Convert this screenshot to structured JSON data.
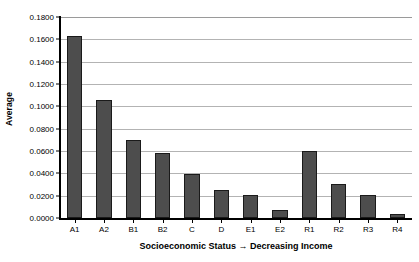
{
  "chart_data": {
    "type": "bar",
    "title": "",
    "xlabel": "Socioeconomic Status → Decreasing Income",
    "ylabel": "Average",
    "categories": [
      "A1",
      "A2",
      "B1",
      "B2",
      "C",
      "D",
      "E1",
      "E2",
      "R1",
      "R2",
      "R3",
      "R4"
    ],
    "values": [
      0.163,
      0.106,
      0.07,
      0.0585,
      0.039,
      0.025,
      0.0205,
      0.007,
      0.06,
      0.0305,
      0.0205,
      0.0035
    ],
    "series": [
      {
        "name": "Average",
        "values": [
          0.163,
          0.106,
          0.07,
          0.0585,
          0.039,
          0.025,
          0.0205,
          0.007,
          0.06,
          0.0305,
          0.0205,
          0.0035
        ]
      }
    ],
    "ylim": [
      0.0,
      0.18
    ],
    "ytick_step": 0.02,
    "ytick_labels": [
      "0.1800",
      "0.1600",
      "0.1400",
      "0.1200",
      "0.1000",
      "0.0800",
      "0.0600",
      "0.0400",
      "0.0200",
      "0.0000"
    ],
    "ytick_values": [
      0.18,
      0.16,
      0.14,
      0.12,
      0.1,
      0.08,
      0.06,
      0.04,
      0.02,
      0.0
    ],
    "grid": true,
    "grid_axis": "y",
    "legend": false,
    "legend_position": "none",
    "bar_color": "#4d4d4d",
    "bar_border_color": "#1a1a1a",
    "gridline_color": "#b3b3b3",
    "axis_color": "#000000",
    "background_color": "#ffffff"
  }
}
